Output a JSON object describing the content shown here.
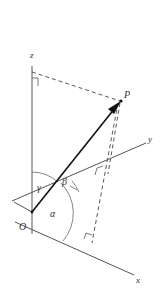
{
  "figure": {
    "labels": {
      "z_axis": "z",
      "y_axis": "y",
      "x_axis": "x",
      "origin": "O",
      "point": "P",
      "alpha": "α",
      "beta": "β",
      "gamma": "γ"
    },
    "colors": {
      "axis": "#555555",
      "vector": "#111111",
      "dashed": "#444444",
      "text": "#333333"
    }
  }
}
